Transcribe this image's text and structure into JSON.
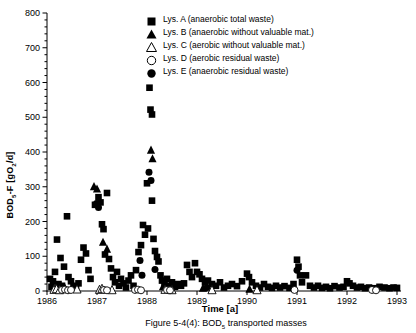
{
  "figure": {
    "caption_parts": [
      "Figure 5-4(4): BOD",
      "5",
      " transported masses"
    ]
  },
  "chart_data": {
    "type": "scatter",
    "title": "",
    "xlabel": "Time [a]",
    "ylabel_parts": [
      "BOD",
      "5",
      "-F [gO",
      "2",
      "/d]"
    ],
    "xlim": [
      1986,
      1993
    ],
    "ylim": [
      0,
      800
    ],
    "xticks": [
      1986,
      1987,
      1988,
      1989,
      1990,
      1991,
      1992,
      1993
    ],
    "yticks": [
      0,
      100,
      200,
      300,
      400,
      500,
      600,
      700,
      800
    ],
    "y_minor_step": 20,
    "grid": false,
    "legend_position": "top-right",
    "marker_color": "#000000",
    "background": "#ffffff",
    "series": [
      {
        "name": "Lys. A",
        "label": "Lys. A (anaerobic total waste)",
        "marker": "square-filled",
        "points": [
          [
            1986.06,
            35
          ],
          [
            1986.09,
            12
          ],
          [
            1986.12,
            28
          ],
          [
            1986.16,
            55
          ],
          [
            1986.2,
            148
          ],
          [
            1986.23,
            20
          ],
          [
            1986.27,
            95
          ],
          [
            1986.3,
            15
          ],
          [
            1986.34,
            70
          ],
          [
            1986.4,
            215
          ],
          [
            1986.43,
            40
          ],
          [
            1986.48,
            28
          ],
          [
            1986.53,
            15
          ],
          [
            1986.58,
            8
          ],
          [
            1986.63,
            22
          ],
          [
            1986.68,
            90
          ],
          [
            1986.73,
            125
          ],
          [
            1986.78,
            108
          ],
          [
            1986.83,
            60
          ],
          [
            1986.87,
            35
          ],
          [
            1986.96,
            248
          ],
          [
            1987.03,
            270
          ],
          [
            1987.07,
            255
          ],
          [
            1987.1,
            192
          ],
          [
            1987.13,
            178
          ],
          [
            1987.16,
            105
          ],
          [
            1987.2,
            282
          ],
          [
            1987.24,
            92
          ],
          [
            1987.28,
            65
          ],
          [
            1987.32,
            40
          ],
          [
            1987.36,
            25
          ],
          [
            1987.4,
            55
          ],
          [
            1987.44,
            15
          ],
          [
            1987.48,
            35
          ],
          [
            1987.53,
            22
          ],
          [
            1987.58,
            10
          ],
          [
            1987.63,
            30
          ],
          [
            1987.68,
            45
          ],
          [
            1987.73,
            15
          ],
          [
            1987.78,
            60
          ],
          [
            1987.83,
            112
          ],
          [
            1987.88,
            132
          ],
          [
            1987.92,
            190
          ],
          [
            1987.96,
            162
          ],
          [
            1988.0,
            310
          ],
          [
            1988.02,
            180
          ],
          [
            1988.05,
            585
          ],
          [
            1988.07,
            522
          ],
          [
            1988.1,
            508
          ],
          [
            1988.1,
            260
          ],
          [
            1988.13,
            150
          ],
          [
            1988.16,
            115
          ],
          [
            1988.2,
            98
          ],
          [
            1988.23,
            85
          ],
          [
            1988.27,
            45
          ],
          [
            1988.3,
            30
          ],
          [
            1988.35,
            20
          ],
          [
            1988.4,
            35
          ],
          [
            1988.45,
            15
          ],
          [
            1988.5,
            25
          ],
          [
            1988.56,
            12
          ],
          [
            1988.62,
            20
          ],
          [
            1988.68,
            15
          ],
          [
            1988.74,
            22
          ],
          [
            1988.8,
            75
          ],
          [
            1988.85,
            55
          ],
          [
            1988.9,
            40
          ],
          [
            1988.96,
            80
          ],
          [
            1989.0,
            55
          ],
          [
            1989.05,
            48
          ],
          [
            1989.1,
            35
          ],
          [
            1989.16,
            25
          ],
          [
            1989.22,
            30
          ],
          [
            1989.3,
            20
          ],
          [
            1989.38,
            15
          ],
          [
            1989.46,
            25
          ],
          [
            1989.54,
            10
          ],
          [
            1989.62,
            15
          ],
          [
            1989.7,
            20
          ],
          [
            1989.8,
            14
          ],
          [
            1989.9,
            28
          ],
          [
            1990.0,
            50
          ],
          [
            1990.04,
            40
          ],
          [
            1990.1,
            25
          ],
          [
            1990.18,
            15
          ],
          [
            1990.26,
            10
          ],
          [
            1990.34,
            20
          ],
          [
            1990.42,
            12
          ],
          [
            1990.5,
            9
          ],
          [
            1990.58,
            15
          ],
          [
            1990.66,
            10
          ],
          [
            1990.75,
            14
          ],
          [
            1990.85,
            9
          ],
          [
            1990.93,
            20
          ],
          [
            1991.0,
            90
          ],
          [
            1991.03,
            70
          ],
          [
            1991.06,
            45
          ],
          [
            1991.1,
            25
          ],
          [
            1991.18,
            45
          ],
          [
            1991.26,
            15
          ],
          [
            1991.34,
            10
          ],
          [
            1991.42,
            15
          ],
          [
            1991.5,
            9
          ],
          [
            1991.58,
            12
          ],
          [
            1991.66,
            8
          ],
          [
            1991.75,
            14
          ],
          [
            1991.85,
            10
          ],
          [
            1991.93,
            12
          ],
          [
            1992.0,
            28
          ],
          [
            1992.05,
            22
          ],
          [
            1992.12,
            15
          ],
          [
            1992.2,
            10
          ],
          [
            1992.28,
            12
          ],
          [
            1992.36,
            8
          ],
          [
            1992.44,
            10
          ],
          [
            1992.55,
            8
          ],
          [
            1992.65,
            12
          ],
          [
            1992.75,
            10
          ],
          [
            1992.85,
            8
          ],
          [
            1992.93,
            10
          ],
          [
            1993.0,
            9
          ]
        ]
      },
      {
        "name": "Lys. B",
        "label": "Lys. B (anaerobic without valuable mat.)",
        "marker": "triangle-filled",
        "points": [
          [
            1986.36,
            8
          ],
          [
            1986.94,
            300
          ],
          [
            1987.0,
            293
          ],
          [
            1987.12,
            140
          ],
          [
            1987.2,
            120
          ],
          [
            1988.08,
            405
          ],
          [
            1988.11,
            380
          ],
          [
            1988.32,
            12
          ],
          [
            1989.12,
            8
          ],
          [
            1990.05,
            5
          ]
        ]
      },
      {
        "name": "Lys. C",
        "label": "Lys. C (aerobic without valuable mat.)",
        "marker": "triangle-open",
        "points": [
          [
            1986.14,
            3
          ],
          [
            1986.19,
            5
          ],
          [
            1986.25,
            2
          ],
          [
            1986.6,
            4
          ],
          [
            1987.05,
            3
          ],
          [
            1987.1,
            6
          ],
          [
            1987.3,
            2
          ],
          [
            1988.36,
            3
          ],
          [
            1988.5,
            2
          ],
          [
            1989.3,
            2
          ],
          [
            1990.2,
            2
          ]
        ]
      },
      {
        "name": "Lys. D",
        "label": "Lys. D (aerobic residual waste)",
        "marker": "circle-open",
        "points": [
          [
            1986.3,
            3
          ],
          [
            1986.36,
            4
          ],
          [
            1986.42,
            2
          ],
          [
            1986.48,
            3
          ],
          [
            1987.14,
            3
          ],
          [
            1987.2,
            2
          ],
          [
            1987.76,
            3
          ],
          [
            1987.82,
            4
          ],
          [
            1987.88,
            2
          ],
          [
            1988.4,
            3
          ],
          [
            1988.46,
            2
          ],
          [
            1990.95,
            3
          ],
          [
            1992.5,
            3
          ],
          [
            1992.58,
            2
          ]
        ]
      },
      {
        "name": "Lys. E",
        "label": "Lys. E (anaerobic residual waste)",
        "marker": "circle-filled",
        "points": [
          [
            1986.99,
            252
          ],
          [
            1987.03,
            240
          ],
          [
            1987.86,
            88
          ],
          [
            1987.9,
            45
          ],
          [
            1988.04,
            342
          ],
          [
            1988.08,
            318
          ],
          [
            1988.16,
            62
          ],
          [
            1989.2,
            10
          ],
          [
            1991.0,
            60
          ],
          [
            1992.5,
            6
          ]
        ]
      }
    ]
  }
}
